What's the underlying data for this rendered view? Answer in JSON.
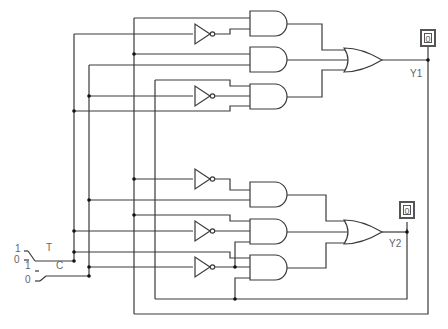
{
  "diagram": {
    "type": "logic-circuit",
    "inputs": [
      {
        "name": "T",
        "switch_labels": [
          "1",
          "0"
        ]
      },
      {
        "name": "C",
        "switch_labels": [
          "1",
          "0"
        ]
      }
    ],
    "outputs": [
      {
        "name": "Y1",
        "probe_value": "0"
      },
      {
        "name": "Y2",
        "probe_value": "0"
      }
    ],
    "gates": {
      "not_count": 5,
      "and_count": 6,
      "or_count": 2
    }
  },
  "labels": {
    "switch_t_top": "1",
    "switch_t_bottom": "0",
    "switch_c_top": "1",
    "switch_c_bottom": "0",
    "input_t": "T",
    "input_c": "C",
    "output_y1": "Y1",
    "output_y2": "Y2",
    "probe_y1": "0",
    "probe_y2": "0"
  }
}
